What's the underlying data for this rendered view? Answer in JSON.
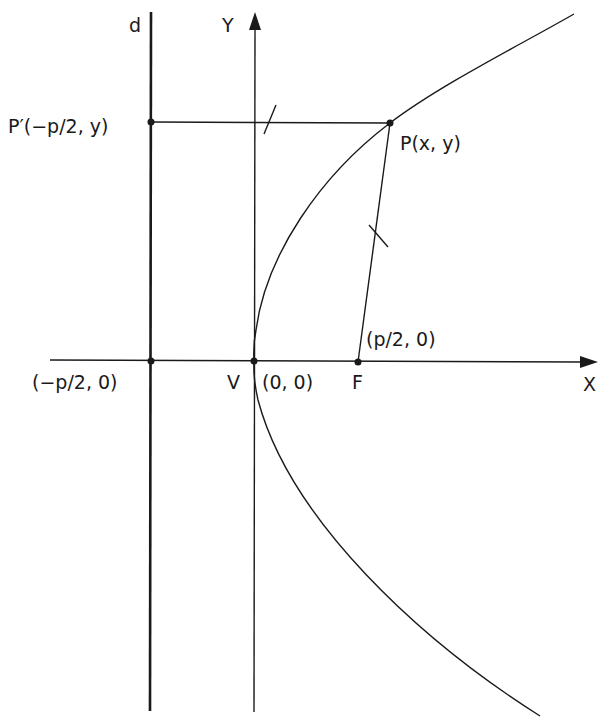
{
  "diagram": {
    "labels": {
      "directrix": "d",
      "y_axis": "Y",
      "x_axis": "X",
      "p_prime": "P′(−p/2, y)",
      "p": "P(x, y)",
      "focus_coords": "(p/2, 0)",
      "directrix_point": "(−p/2, 0)",
      "vertex": "V",
      "vertex_coords": "(0, 0)",
      "focus": "F"
    },
    "points": [
      {
        "name": "P′",
        "x": 151,
        "y": 122
      },
      {
        "name": "P",
        "x": 390,
        "y": 123
      },
      {
        "name": "directrix-axis-intersection",
        "x": 151,
        "y": 361
      },
      {
        "name": "V",
        "x": 254,
        "y": 361
      },
      {
        "name": "F",
        "x": 358,
        "y": 362
      }
    ],
    "colors": {
      "stroke": "#1a1a1a",
      "background": "#ffffff"
    }
  }
}
